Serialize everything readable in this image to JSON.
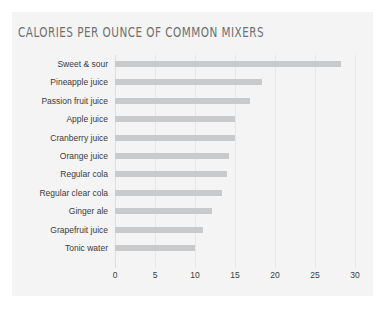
{
  "chart_data": {
    "type": "bar",
    "orientation": "horizontal",
    "title": "Calories per ounce of common mixers",
    "xlabel": "",
    "ylabel": "",
    "xlim": [
      0,
      30
    ],
    "xticks": [
      0,
      5,
      10,
      15,
      20,
      25,
      30
    ],
    "xtick_labels": [
      "0",
      "5",
      "10",
      "15",
      "20",
      "25",
      "30"
    ],
    "grid": true,
    "legend": null,
    "bar_color": "#c9cacb",
    "panel_color": "#f4f4f4",
    "title_color": "#6f7073",
    "label_color": "#3a3b3d",
    "categories": [
      "Sweet & sour",
      "Pineapple juice",
      "Passion fruit juice",
      "Apple juice",
      "Cranberry juice",
      "Orange juice",
      "Regular cola",
      "Regular clear cola",
      "Ginger ale",
      "Grapefruit juice",
      "Tonic water"
    ],
    "values": [
      28.3,
      18.4,
      16.9,
      15.0,
      15.0,
      14.2,
      14.0,
      13.4,
      12.1,
      11.0,
      10.0
    ]
  }
}
